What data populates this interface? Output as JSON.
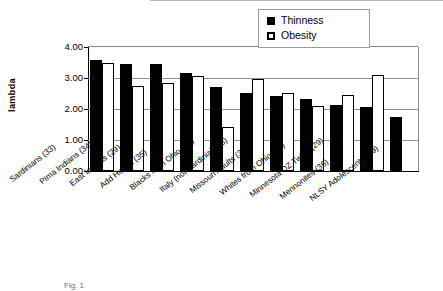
{
  "chart_data": {
    "type": "bar",
    "title": "",
    "xlabel": "",
    "ylabel": "lambda",
    "ylim": [
      0.0,
      4.0
    ],
    "ytick_labels": [
      "4.00",
      "3.00",
      "2.00",
      "1.00",
      "0.00"
    ],
    "ytick_values": [
      4.0,
      3.0,
      2.0,
      1.0,
      0.0
    ],
    "grid": true,
    "legend_position": "top-right",
    "categories": [
      "Sardinians (33)",
      "Pima Indians (34)",
      "East Indians (29)",
      "Add Health (35)",
      "Blacks from Ohio (31)",
      "Italy (not Sardinia) (33)",
      "Missouri Adults (32)",
      "Whites from Ohio (31)",
      "Minnesota DZ Twins (29)",
      "Mennonites (36)",
      "NLSY Adolescents (29)"
    ],
    "series": [
      {
        "name": "Thinness",
        "color": "#000000",
        "values": [
          3.58,
          3.46,
          3.44,
          3.15,
          2.72,
          2.52,
          2.43,
          2.31,
          2.13,
          2.08,
          1.75
        ]
      },
      {
        "name": "Obesity",
        "color": "#ffffff",
        "values": [
          3.5,
          2.74,
          2.84,
          3.08,
          1.42,
          2.97,
          2.51,
          2.09,
          2.45,
          3.11,
          null
        ]
      }
    ]
  },
  "legend": {
    "items": [
      {
        "label": "Thinness",
        "marker": "filled-square-icon"
      },
      {
        "label": "Obesity",
        "marker": "open-square-icon"
      }
    ]
  },
  "caption": "Fig. 1"
}
